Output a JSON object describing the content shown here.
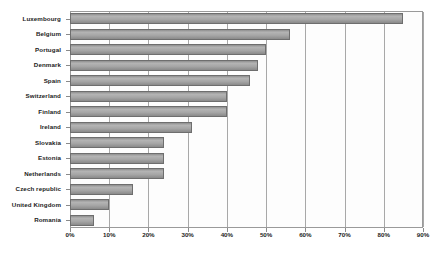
{
  "chart_data": {
    "type": "bar",
    "orientation": "horizontal",
    "title": "",
    "subtitle": "",
    "xlabel": "",
    "ylabel": "",
    "xlim": [
      0,
      90
    ],
    "ylim": null,
    "grid": true,
    "legend": null,
    "legend_position": "none",
    "x_tick_labels": [
      "0%",
      "10%",
      "20%",
      "30%",
      "40%",
      "50%",
      "60%",
      "70%",
      "80%",
      "90%"
    ],
    "x_tick_values": [
      0,
      10,
      20,
      30,
      40,
      50,
      60,
      70,
      80,
      90
    ],
    "categories": [
      "Luxembourg",
      "Belgium",
      "Portugal",
      "Denmark",
      "Spain",
      "Switzerland",
      "Finland",
      "Ireland",
      "Slovakia",
      "Estonia",
      "Netherlands",
      "Czech republic",
      "United Kingdom",
      "Romania"
    ],
    "values": [
      85,
      56,
      50,
      48,
      46,
      40,
      40,
      31,
      24,
      24,
      24,
      16,
      10,
      6
    ],
    "series": [
      {
        "name": "",
        "values": [
          85,
          56,
          50,
          48,
          46,
          40,
          40,
          31,
          24,
          24,
          24,
          16,
          10,
          6
        ]
      }
    ],
    "bar_color": "#a6a6a6",
    "bar_border_color": "#6e6e6e",
    "plot_border_color": "#9a9a9a",
    "gridline_color": "#a8a8a8",
    "background_color": "#ffffff"
  }
}
